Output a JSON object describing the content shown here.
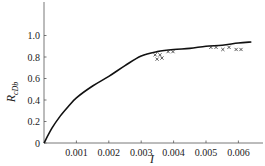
{
  "chart_data": {
    "type": "line",
    "title": "",
    "xlabel": "I",
    "ylabel": "R",
    "ylabel_subscript": "cDb",
    "xlim": [
      0,
      0.0068
    ],
    "ylim": [
      0,
      1.25
    ],
    "grid": false,
    "legend": null,
    "x_ticks": [
      {
        "value": 0.001,
        "label": "0.001"
      },
      {
        "value": 0.002,
        "label": "0.002"
      },
      {
        "value": 0.003,
        "label": "0.003"
      },
      {
        "value": 0.004,
        "label": "0.004"
      },
      {
        "value": 0.005,
        "label": "0.005"
      },
      {
        "value": 0.006,
        "label": "0.006"
      }
    ],
    "y_ticks": [
      {
        "value": 0,
        "label": "0"
      },
      {
        "value": 0.2,
        "label": "0.2"
      },
      {
        "value": 0.4,
        "label": "0.4"
      },
      {
        "value": 0.6,
        "label": "0.6"
      },
      {
        "value": 0.8,
        "label": "0.8"
      },
      {
        "value": 1.0,
        "label": "1.0"
      }
    ],
    "series": [
      {
        "name": "model curve",
        "kind": "line",
        "color": "#111111",
        "x": [
          0,
          0.00025,
          0.0005,
          0.00075,
          0.001,
          0.0015,
          0.002,
          0.0025,
          0.003,
          0.0035,
          0.004,
          0.0045,
          0.005,
          0.0055,
          0.006,
          0.0064
        ],
        "y": [
          0,
          0.14,
          0.25,
          0.34,
          0.42,
          0.53,
          0.62,
          0.72,
          0.81,
          0.85,
          0.87,
          0.88,
          0.9,
          0.91,
          0.93,
          0.94
        ]
      },
      {
        "name": "measured",
        "kind": "scatter",
        "marker": "x",
        "color": "#333333",
        "x": [
          0.00343,
          0.00358,
          0.00349,
          0.00364,
          0.00383,
          0.00398,
          0.00515,
          0.00531,
          0.00552,
          0.00571,
          0.00593,
          0.00608
        ],
        "y": [
          0.82,
          0.82,
          0.78,
          0.79,
          0.85,
          0.85,
          0.89,
          0.89,
          0.87,
          0.89,
          0.87,
          0.87
        ]
      }
    ]
  }
}
